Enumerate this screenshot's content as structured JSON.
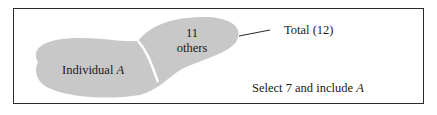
{
  "diagram": {
    "regions": {
      "individual": {
        "label": "Individual",
        "variable": "A"
      },
      "others": {
        "count": "11",
        "label": "others"
      }
    },
    "total_label": "Total (12)",
    "instruction": {
      "text": "Select 7 and include",
      "variable": "A"
    },
    "colors": {
      "fill": "#c8c8c8",
      "border": "#2a2a2a",
      "divider": "#ffffff"
    }
  }
}
